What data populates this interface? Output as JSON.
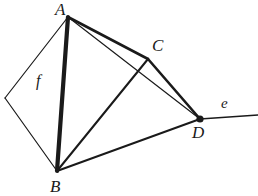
{
  "figure": {
    "width": 258,
    "height": 196,
    "background_color": "#ffffff",
    "stroke_color": "#1a1a1a",
    "labels": {
      "vertex_a": "A",
      "vertex_b": "B",
      "vertex_c": "C",
      "vertex_d": "D",
      "region_f": "f",
      "line_e": "e"
    },
    "label_positions": {
      "vertex_a": {
        "x": 55,
        "y": 1
      },
      "vertex_b": {
        "x": 50,
        "y": 178
      },
      "vertex_c": {
        "x": 152,
        "y": 37
      },
      "vertex_d": {
        "x": 192,
        "y": 124
      },
      "region_f": {
        "x": 36,
        "y": 73
      },
      "line_e": {
        "x": 221,
        "y": 96
      }
    },
    "points": {
      "A": {
        "x": 68,
        "y": 17,
        "label": "A"
      },
      "B": {
        "x": 57,
        "y": 171,
        "label": "B"
      },
      "C": {
        "x": 148,
        "y": 59,
        "label": "C"
      },
      "D": {
        "x": 200,
        "y": 119,
        "label": "D"
      },
      "L": {
        "x": 5,
        "y": 98,
        "label": ""
      },
      "E": {
        "x": 258,
        "y": 115,
        "label": ""
      }
    },
    "markers": [
      {
        "name": "vertex-dot-d",
        "x": 200,
        "y": 119,
        "r": 3.6,
        "color": "#1a1a1a"
      }
    ],
    "segments": [
      {
        "name": "segment-a-b",
        "from": "A",
        "to": "B",
        "width": 4.2,
        "style": "thick"
      },
      {
        "name": "segment-a-c",
        "from": "A",
        "to": "C",
        "width": 2.6,
        "style": "medium"
      },
      {
        "name": "segment-a-d",
        "from": "A",
        "to": "D",
        "width": 1.2,
        "style": "thin"
      },
      {
        "name": "segment-c-d",
        "from": "C",
        "to": "D",
        "width": 2.6,
        "style": "medium"
      },
      {
        "name": "segment-b-c",
        "from": "B",
        "to": "C",
        "width": 2.0,
        "style": "medium"
      },
      {
        "name": "segment-b-d",
        "from": "B",
        "to": "D",
        "width": 2.0,
        "style": "medium"
      },
      {
        "name": "segment-a-left",
        "from": "A",
        "to": "L",
        "width": 1.2,
        "style": "thin"
      },
      {
        "name": "segment-left-b",
        "from": "L",
        "to": "B",
        "width": 1.2,
        "style": "thin"
      },
      {
        "name": "segment-d-e",
        "from": "D",
        "to": "E",
        "width": 1.6,
        "style": "thin"
      }
    ]
  }
}
